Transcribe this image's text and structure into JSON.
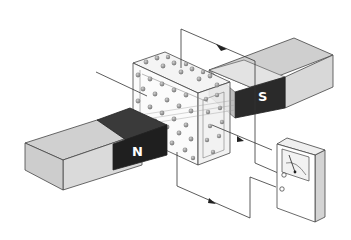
{
  "diagram": {
    "type": "hall-effect-apparatus",
    "magnets": {
      "north": {
        "label": "N",
        "color_pole": "#2a2a2a",
        "color_body": "#d6d6d6"
      },
      "south": {
        "label": "S",
        "color_pole": "#2a2a2a",
        "color_body": "#d6d6d6"
      }
    },
    "block": {
      "description": "transparent conductor slab with charge carriers",
      "dot_color": "#8a8a8a"
    },
    "meter": {
      "description": "voltmeter/galvanometer with needle dial"
    },
    "colors": {
      "line": "#333333",
      "background": "#ffffff"
    }
  }
}
